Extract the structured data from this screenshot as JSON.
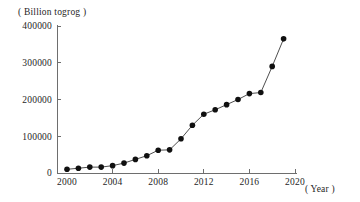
{
  "chart_data": {
    "type": "line",
    "title": "",
    "subtitle": "",
    "ylabel": "( Billion togrog )",
    "xlabel": "( Year )",
    "grid": false,
    "legend": null,
    "markers": "filled-circle",
    "xlim": [
      2000,
      2020
    ],
    "ylim": [
      0,
      400000
    ],
    "x_ticks": [
      "2000",
      "2004",
      "2008",
      "2012",
      "2016",
      "2020"
    ],
    "x_tick_values": [
      2000,
      2004,
      2008,
      2012,
      2016,
      2020
    ],
    "y_ticks": [
      "0",
      "100000",
      "200000",
      "300000",
      "400000"
    ],
    "y_tick_values": [
      0,
      100000,
      200000,
      300000,
      400000
    ],
    "x": [
      2000,
      2001,
      2002,
      2003,
      2004,
      2005,
      2006,
      2007,
      2008,
      2009,
      2010,
      2011,
      2012,
      2013,
      2014,
      2015,
      2016,
      2017,
      2018,
      2019
    ],
    "values": [
      10000,
      13000,
      16000,
      16000,
      20000,
      27000,
      37000,
      47000,
      62000,
      63000,
      93000,
      130000,
      160000,
      172000,
      186000,
      200000,
      216000,
      219000,
      290000,
      365000
    ],
    "series": [
      {
        "name": "Total",
        "values": [
          10000,
          13000,
          16000,
          16000,
          20000,
          27000,
          37000,
          47000,
          62000,
          63000,
          93000,
          130000,
          160000,
          172000,
          186000,
          200000,
          216000,
          219000,
          290000,
          365000
        ]
      }
    ]
  },
  "axes": {
    "y_caption": "( Billion togrog )",
    "x_caption": "( Year )"
  }
}
